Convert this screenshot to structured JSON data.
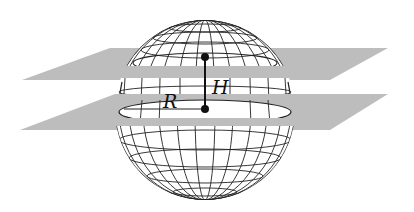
{
  "diagram": {
    "labels": {
      "radius": "R",
      "height": "H"
    },
    "colors": {
      "plane": "#b8b8b8",
      "grid": "#222222",
      "sphere_fill": "#ffffff"
    }
  }
}
